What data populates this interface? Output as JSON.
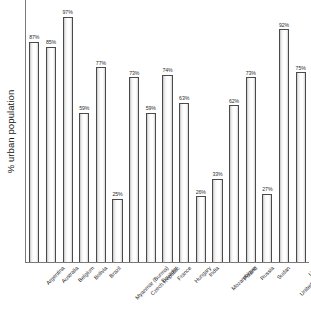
{
  "chart_data": {
    "type": "bar",
    "title": "",
    "subtitle": "",
    "xlabel": "",
    "ylabel": "% urban population",
    "ylim": [
      0,
      100
    ],
    "grid": false,
    "legend": null,
    "value_label_suffix": "%",
    "categories": [
      "Argentina",
      "Australia",
      "Belgium",
      "Bolivia",
      "Brazil",
      "Myanmar (Burma)",
      "Czech Republic",
      "Ecuador",
      "France",
      "Hungary",
      "India",
      "Mozambique",
      "Poland",
      "Russia",
      "Sudan",
      "United Kingdom",
      "USA"
    ],
    "values": [
      87,
      85,
      97,
      59,
      77,
      25,
      73,
      59,
      74,
      63,
      26,
      33,
      62,
      73,
      27,
      92,
      75
    ],
    "value_labels": [
      "87%",
      "85%",
      "97%",
      "59%",
      "77%",
      "25%",
      "73%",
      "59%",
      "74%",
      "63%",
      "26%",
      "33%",
      "62%",
      "73%",
      "27%",
      "92%",
      "75%"
    ],
    "bars": [
      {
        "category": "Argentina",
        "value": 87,
        "label": "87%"
      },
      {
        "category": "Australia",
        "value": 85,
        "label": "85%"
      },
      {
        "category": "Belgium",
        "value": 97,
        "label": "97%"
      },
      {
        "category": "Bolivia",
        "value": 59,
        "label": "59%"
      },
      {
        "category": "Brazil",
        "value": 77,
        "label": "77%"
      },
      {
        "category": "Myanmar (Burma)",
        "value": 25,
        "label": "25%"
      },
      {
        "category": "Czech Republic",
        "value": 73,
        "label": "73%"
      },
      {
        "category": "Ecuador",
        "value": 59,
        "label": "59%"
      },
      {
        "category": "France",
        "value": 74,
        "label": "74%"
      },
      {
        "category": "Hungary",
        "value": 63,
        "label": "63%"
      },
      {
        "category": "India",
        "value": 26,
        "label": "26%"
      },
      {
        "category": "Mozambique",
        "value": 33,
        "label": "33%"
      },
      {
        "category": "Poland",
        "value": 62,
        "label": "62%"
      },
      {
        "category": "Russia",
        "value": 73,
        "label": "73%"
      },
      {
        "category": "Sudan",
        "value": 27,
        "label": "27%"
      },
      {
        "category": "United Kingdom",
        "value": 92,
        "label": "92%"
      },
      {
        "category": "USA",
        "value": 75,
        "label": "75%"
      }
    ],
    "colors": {
      "bar_outline": "#4a4a4a",
      "bar_fill_light": "#ffffff",
      "bar_fill_shade": "#c6c6c6",
      "axis": "#7a7a7a",
      "text": "#1a1a1a",
      "background": "#ffffff"
    }
  }
}
